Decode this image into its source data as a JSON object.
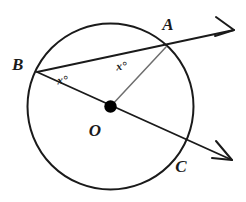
{
  "figure": {
    "type": "circle-geometry-diagram",
    "background_color": "#ffffff",
    "line_color": "#1a1a1a",
    "radius_color": "#6e6e6e"
  },
  "circle": {
    "center_x": 110.5,
    "center_y": 106.5,
    "radius": 83,
    "label": "circle-O"
  },
  "points": [
    {
      "id": "A",
      "label": "A",
      "x": 166,
      "y": 47,
      "label_x": 168,
      "label_y": 30,
      "on_circle": true
    },
    {
      "id": "B",
      "label": "B",
      "x": 37,
      "y": 72,
      "label_x": 12,
      "label_y": 70,
      "on_circle": true
    },
    {
      "id": "C",
      "label": "C",
      "x": 181,
      "y": 142,
      "label_x": 181,
      "label_y": 172,
      "on_circle": true
    },
    {
      "id": "O",
      "label": "O",
      "x": 110.5,
      "y": 106.5,
      "label_x": 95,
      "label_y": 136,
      "on_circle": false
    }
  ],
  "center_dot": {
    "x": 110.5,
    "y": 106.5,
    "radius": 6.2,
    "color": "#000000"
  },
  "segments": [
    {
      "id": "ray-BA",
      "from": "B",
      "through": "A",
      "tip_x": 234,
      "tip_y": 30,
      "style": "main",
      "arrow": true
    },
    {
      "id": "ray-BOC",
      "from": "B",
      "through": "C",
      "tip_x": 232,
      "tip_y": 160,
      "style": "main",
      "arrow": true
    },
    {
      "id": "radius-OA",
      "from": "O",
      "through": "A",
      "style": "radius",
      "arrow": false
    }
  ],
  "angle_labels": [
    {
      "id": "angle-at-B",
      "text": "x°",
      "x": 63,
      "y": 84,
      "vertex": "B",
      "rotation": -6
    },
    {
      "id": "angle-at-A",
      "text": "x°",
      "x": 122,
      "y": 70,
      "vertex": "A",
      "rotation": -6
    }
  ],
  "arrowheads": [
    {
      "id": "arrowhead-upper",
      "tip_x": 234,
      "tip_y": 30,
      "path": "M 216 17 L 234 30 L 215 36"
    },
    {
      "id": "arrowhead-lower",
      "tip_x": 232,
      "tip_y": 160,
      "path": "M 216 141 L 232 160 L 212 158"
    }
  ]
}
